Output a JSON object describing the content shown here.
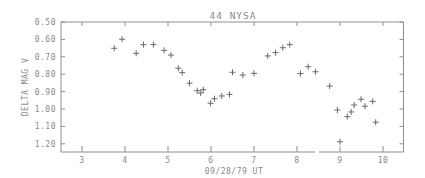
{
  "chart_data": {
    "type": "scatter",
    "title": "44 NYSA",
    "xlabel": "09/28/79 UT",
    "ylabel": "DELTA MAG V",
    "xlim": [
      2.54,
      10.49
    ],
    "ylim": [
      1.25,
      0.5
    ],
    "y_inverted": true,
    "grid": false,
    "legend": null,
    "marker": "+",
    "x_ticks": [
      3,
      4,
      5,
      6,
      7,
      8,
      9,
      10
    ],
    "x_tick_labels": [
      "3",
      "4",
      "5",
      "6",
      "7",
      "8",
      "9",
      "10"
    ],
    "y_ticks": [
      0.5,
      0.6,
      0.7,
      0.8,
      0.9,
      1.0,
      1.1,
      1.2
    ],
    "y_tick_labels": [
      "0.50",
      "0.60",
      "0.70",
      "0.80",
      "0.90",
      "1.00",
      "1.10",
      "1.20"
    ],
    "series": [
      {
        "name": "44 Nysa V-band photometry",
        "x": [
          3.75,
          3.93,
          4.26,
          4.43,
          4.66,
          4.91,
          5.07,
          5.24,
          5.33,
          5.5,
          5.68,
          5.76,
          5.82,
          5.99,
          6.08,
          6.25,
          6.43,
          6.5,
          6.74,
          7.0,
          7.32,
          7.5,
          7.67,
          7.83,
          8.08,
          8.26,
          8.43,
          8.76,
          8.94,
          9.0,
          9.17,
          9.26,
          9.33,
          9.49,
          9.58,
          9.76,
          9.83
        ],
        "y": [
          0.651,
          0.599,
          0.68,
          0.63,
          0.63,
          0.663,
          0.69,
          0.766,
          0.791,
          0.852,
          0.895,
          0.908,
          0.889,
          0.967,
          0.941,
          0.925,
          0.916,
          0.789,
          0.805,
          0.795,
          0.695,
          0.676,
          0.648,
          0.63,
          0.796,
          0.757,
          0.786,
          0.868,
          1.006,
          1.188,
          1.044,
          1.017,
          0.977,
          0.944,
          0.984,
          0.956,
          1.076
        ]
      }
    ]
  },
  "colors": {
    "axis": "#8f8f8f",
    "text": "#8a8a8a",
    "marker": "#6a6a6a",
    "background": "#ffffff"
  }
}
